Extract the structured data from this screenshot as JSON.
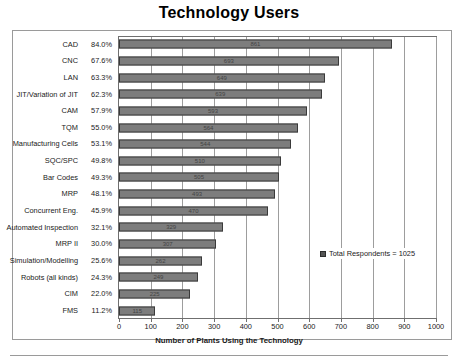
{
  "chart_data": {
    "type": "bar",
    "orientation": "horizontal",
    "title": "Technology Users",
    "xlabel": "Number of Plants Using the Technology",
    "ylabel": "",
    "xlim": [
      0,
      1000
    ],
    "xticks": [
      0,
      100,
      200,
      300,
      400,
      500,
      600,
      700,
      800,
      900,
      1000
    ],
    "grid": "vertical",
    "legend_position": "inside-lower-right",
    "legend": [
      "Total Respondents = 1025"
    ],
    "total_respondents": 1025,
    "categories": [
      "CAD",
      "CNC",
      "LAN",
      "JIT/Variation of JIT",
      "CAM",
      "TQM",
      "Manufacturing Cells",
      "SQC/SPC",
      "Bar Codes",
      "MRP",
      "Concurrent Eng.",
      "Automated Inspection",
      "MRP II",
      "Simulation/Modelling",
      "Robots (all kinds)",
      "CIM",
      "FMS"
    ],
    "percent_labels": [
      "84.0%",
      "67.6%",
      "63.3%",
      "62.3%",
      "57.9%",
      "55.0%",
      "53.1%",
      "49.8%",
      "49.3%",
      "48.1%",
      "45.9%",
      "32.1%",
      "30.0%",
      "25.6%",
      "24.3%",
      "22.0%",
      "11.2%"
    ],
    "percents": [
      84.0,
      67.6,
      63.3,
      62.3,
      57.9,
      55.0,
      53.1,
      49.8,
      49.3,
      48.1,
      45.9,
      32.1,
      30.0,
      25.6,
      24.3,
      22.0,
      11.2
    ],
    "values": [
      861,
      693,
      649,
      639,
      593,
      564,
      544,
      510,
      505,
      493,
      470,
      329,
      307,
      262,
      249,
      225,
      115
    ]
  },
  "legend": {
    "label": "Total Respondents = 1025",
    "swatch_color": "#555555"
  },
  "axis": {
    "x_title": "Number of Plants Using the Technology"
  },
  "style": {
    "bar_fill": "#7d7d7d",
    "bar_border": "#3a3a3a",
    "grid_color": "#9d9d9d",
    "frame_color": "#9a9a9a"
  }
}
